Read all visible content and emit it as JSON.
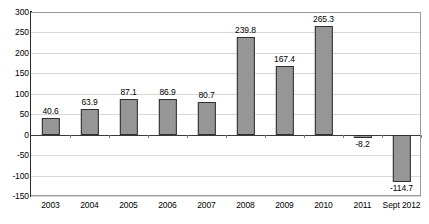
{
  "chart_data": {
    "type": "bar",
    "title": "",
    "subtitle": "",
    "xlabel": "",
    "ylabel": "",
    "categories": [
      "2003",
      "2004",
      "2005",
      "2006",
      "2007",
      "2008",
      "2009",
      "2010",
      "2011",
      "Sept 2012"
    ],
    "values": [
      40.6,
      63.9,
      87.1,
      86.9,
      80.7,
      239.8,
      167.4,
      265.3,
      -8.2,
      -114.7
    ],
    "data_labels": [
      "40.6",
      "63.9",
      "87.1",
      "86.9",
      "80.7",
      "239.8",
      "167.4",
      "265.3",
      "-8.2",
      "-114.7"
    ],
    "ylim": [
      -150,
      300
    ],
    "ytick_values": [
      300,
      250,
      200,
      150,
      100,
      50,
      0,
      -50,
      -100,
      -150
    ],
    "ytick_labels": [
      "300",
      "250",
      "200",
      "150",
      "100",
      "50",
      "0",
      "-50",
      "-100",
      "-150"
    ],
    "grid": true,
    "legend": false,
    "legend_position": "none",
    "colors": {
      "bar_fill": "#969696",
      "bar_border": "#2e2e2e",
      "gridline": "#d8d8d8",
      "axis": "#2b2b2b",
      "plot_background": "#ffffff",
      "text": "#000000"
    }
  }
}
